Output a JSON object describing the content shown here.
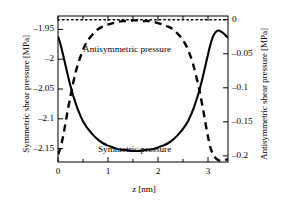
{
  "chart_data": {
    "type": "line",
    "title": "",
    "xlabel": "z [nm]",
    "ylabel": "Symmetric shear pressure [MPa]",
    "ylabel_right": "Antisymmetric shear pressure [MPa]",
    "xlim": [
      0,
      3.4
    ],
    "ylim_left": [
      -2.1725,
      -1.9275
    ],
    "ylim_right": [
      -0.209,
      0.0055
    ],
    "xticks": [
      0,
      1,
      2,
      3
    ],
    "xticklabels": [
      "0",
      "1",
      "2",
      "3"
    ],
    "xminorticks": [
      0.5,
      1.5,
      2.5
    ],
    "yticks_left": [
      -1.95,
      -2,
      -2.05,
      -2.1,
      -2.15
    ],
    "yticklabels_left": [
      "–1.95",
      "–2",
      "–2.05",
      "–2.1",
      "–2.15"
    ],
    "yticks_right": [
      0,
      -0.05,
      -0.1,
      -0.15,
      -0.2
    ],
    "yticklabels_right": [
      "0",
      "–0.05",
      "–0.1",
      "–0.15",
      "–0.2"
    ],
    "grid": false,
    "legend_position": "inline-annotations",
    "series": [
      {
        "name": "Symmetric pressure",
        "axis": "left",
        "style": "solid",
        "color": "#000000",
        "annotation": "Symmetric pressure",
        "x": [
          0.0,
          0.05,
          0.1,
          0.15,
          0.2,
          0.25,
          0.3,
          0.35,
          0.4,
          0.45,
          0.5,
          0.55,
          0.6,
          0.7,
          0.8,
          0.9,
          1.0,
          1.1,
          1.2,
          1.3,
          1.4,
          1.5,
          1.6,
          1.7,
          1.8,
          1.9,
          2.0,
          2.1,
          2.2,
          2.3,
          2.4,
          2.5,
          2.6,
          2.7,
          2.8,
          2.85,
          2.9,
          2.95,
          3.0,
          3.05,
          3.1,
          3.15,
          3.2,
          3.25,
          3.3,
          3.35,
          3.4
        ],
        "y": [
          -1.962,
          -1.975,
          -1.992,
          -2.01,
          -2.028,
          -2.045,
          -2.06,
          -2.073,
          -2.085,
          -2.095,
          -2.104,
          -2.111,
          -2.117,
          -2.127,
          -2.135,
          -2.141,
          -2.145,
          -2.148,
          -2.151,
          -2.152,
          -2.153,
          -2.154,
          -2.154,
          -2.153,
          -2.152,
          -2.151,
          -2.148,
          -2.145,
          -2.141,
          -2.135,
          -2.127,
          -2.117,
          -2.104,
          -2.085,
          -2.06,
          -2.045,
          -2.028,
          -2.01,
          -1.992,
          -1.975,
          -1.962,
          -1.955,
          -1.952,
          -1.953,
          -1.956,
          -1.96,
          -1.964
        ]
      },
      {
        "name": "Antisymmetric pressure",
        "axis": "right",
        "style": "dashed",
        "color": "#000000",
        "annotation": "Antisymmetric pressure",
        "x": [
          0.0,
          0.05,
          0.1,
          0.15,
          0.2,
          0.25,
          0.3,
          0.35,
          0.4,
          0.45,
          0.5,
          0.55,
          0.6,
          0.7,
          0.8,
          0.9,
          1.0,
          1.1,
          1.2,
          1.3,
          1.4,
          1.5,
          1.6,
          1.7,
          1.8,
          1.9,
          2.0,
          2.1,
          2.2,
          2.3,
          2.4,
          2.5,
          2.6,
          2.7,
          2.8,
          2.85,
          2.9,
          2.95,
          3.0,
          3.05,
          3.1,
          3.15,
          3.2,
          3.25,
          3.3,
          3.35,
          3.4
        ],
        "y": [
          -0.198,
          -0.188,
          -0.172,
          -0.152,
          -0.131,
          -0.112,
          -0.094,
          -0.078,
          -0.065,
          -0.054,
          -0.044,
          -0.036,
          -0.03,
          -0.021,
          -0.014,
          -0.01,
          -0.007,
          -0.005,
          -0.003,
          -0.002,
          -0.002,
          -0.001,
          -0.001,
          -0.002,
          -0.002,
          -0.003,
          -0.005,
          -0.007,
          -0.01,
          -0.014,
          -0.021,
          -0.03,
          -0.044,
          -0.065,
          -0.094,
          -0.112,
          -0.131,
          -0.152,
          -0.172,
          -0.188,
          -0.198,
          -0.203,
          -0.206,
          -0.207,
          -0.207,
          -0.206,
          -0.205
        ]
      },
      {
        "name": "Zero reference",
        "axis": "right",
        "style": "dotted",
        "color": "#000000",
        "annotation": "",
        "x": [
          0.0,
          3.4
        ],
        "y": [
          0.0,
          0.0
        ]
      }
    ]
  }
}
